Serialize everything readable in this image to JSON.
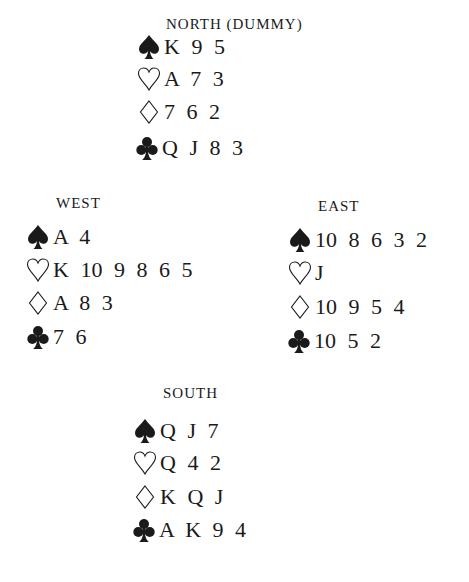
{
  "diagram": {
    "type": "bridge-deal",
    "hands": {
      "north": {
        "title": "NORTH (DUMMY)",
        "spades": "K 9 5",
        "hearts": "A 7 3",
        "diamonds": "7 6 2",
        "clubs": "Q J 8 3"
      },
      "west": {
        "title": "WEST",
        "spades": "A 4",
        "hearts": "K 10 9 8 6 5",
        "diamonds": "A 8 3",
        "clubs": "7 6"
      },
      "east": {
        "title": "EAST",
        "spades": "10 8 6 3 2",
        "hearts": "J",
        "diamonds": "10 9 5 4",
        "clubs": "10 5 2"
      },
      "south": {
        "title": "SOUTH",
        "spades": "Q J 7",
        "hearts": "Q 4 2",
        "diamonds": "K Q J",
        "clubs": "A K 9 4"
      }
    },
    "suit_icons": {
      "spades": "spade-icon (filled)",
      "hearts": "heart-icon (outline)",
      "diamonds": "diamond-icon (outline)",
      "clubs": "club-icon (filled)"
    },
    "colors": {
      "ink": "#1a1a1a",
      "background": "#ffffff"
    }
  }
}
